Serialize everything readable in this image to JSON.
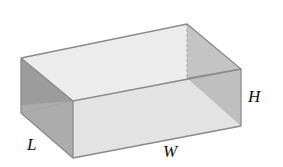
{
  "diagram": {
    "title": "",
    "type": "open-top rectangular box",
    "labels": {
      "length": "L",
      "width": "W",
      "height": "H"
    },
    "colors": {
      "edge": "#8a8a8a",
      "hidden_edge": "#a5a5a5",
      "left_face": "#9a9a9a",
      "right_inner_face": "#b5b5b5",
      "front_face": "#e2e2e2",
      "bottom_inner": "#d4d4d4",
      "back_inner": "#ececec",
      "label": "#111111"
    },
    "vertices": {
      "top_back_left": [
        21,
        58
      ],
      "top_back_right": [
        187,
        24
      ],
      "top_front_right": [
        241,
        69
      ],
      "top_front_left": [
        73,
        101
      ],
      "bottom_front_left": [
        73,
        158
      ],
      "bottom_front_right": [
        241,
        126
      ],
      "bottom_back_left": [
        21,
        113
      ],
      "bottom_back_right": [
        187,
        78
      ]
    }
  }
}
